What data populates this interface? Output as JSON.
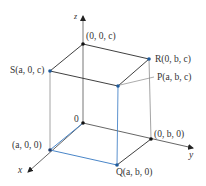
{
  "diagram": {
    "colors": {
      "edge": "#2a2a2a",
      "axis": "#555555",
      "hidden_edge": "#9a9a9a",
      "projection": "#4a86c8",
      "point_blue": "#1f5a9a",
      "point_black": "#111111"
    },
    "axes": {
      "x": "x",
      "y": "y",
      "z": "z"
    },
    "labels": {
      "origin": "0",
      "z_point": "(0, 0, c)",
      "S": "S(a, 0, c)",
      "R": "R(0, b, c)",
      "P": "P(a, b, c)",
      "x_point": "(a, 0, 0)",
      "y_point": "(0, b, 0)",
      "Q": "Q(a, b, 0)"
    }
  }
}
